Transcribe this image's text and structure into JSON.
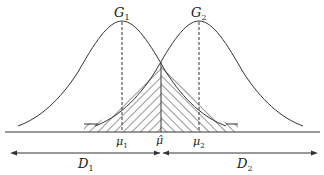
{
  "diagram": {
    "curves": [
      {
        "name": "G1",
        "label": "G",
        "subscript": "1",
        "mean_label": "μ",
        "mean_subscript": "1"
      },
      {
        "name": "G2",
        "label": "G",
        "subscript": "2",
        "mean_label": "μ",
        "mean_subscript": "2"
      }
    ],
    "threshold": {
      "label": "μ̂"
    },
    "regions": [
      {
        "label": "D",
        "subscript": "1",
        "direction": "left"
      },
      {
        "label": "D",
        "subscript": "2",
        "direction": "right"
      }
    ],
    "overlap": "hatched"
  },
  "colors": {
    "stroke": "#333333",
    "background": "#ffffff"
  }
}
